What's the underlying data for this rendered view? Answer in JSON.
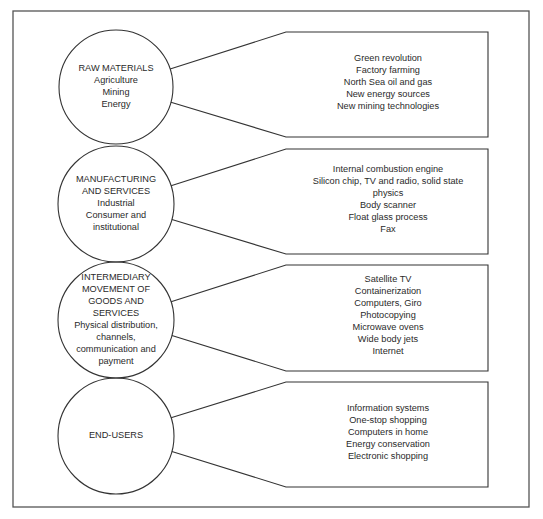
{
  "diagram": {
    "frame": {
      "x": 13,
      "y": 11,
      "w": 516,
      "h": 496,
      "stroke": "#555555"
    },
    "stroke_color": "#333333",
    "rows": [
      {
        "circle": {
          "cx": 116,
          "cy": 87,
          "r": 57
        },
        "circle_lines": [
          "RAW MATERIALS",
          "Agriculture",
          "Mining",
          "Energy"
        ],
        "box": {
          "top": 32,
          "bottom": 137
        },
        "box_lines": [
          "Green revolution",
          "Factory farming",
          "North Sea oil and gas",
          "New energy sources",
          "New mining technologies"
        ]
      },
      {
        "circle": {
          "cx": 116,
          "cy": 204,
          "r": 58
        },
        "circle_lines": [
          "MANUFACTURING",
          "AND SERVICES",
          "Industrial",
          "Consumer and",
          "institutional"
        ],
        "box": {
          "top": 149,
          "bottom": 254
        },
        "box_lines": [
          "Internal combustion engine",
          "Silicon chip, TV and radio, solid state",
          "physics",
          "Body scanner",
          "Float glass process",
          "Fax"
        ]
      },
      {
        "circle": {
          "cx": 116,
          "cy": 320,
          "r": 58
        },
        "circle_lines": [
          "INTERMEDIARY",
          "MOVEMENT OF",
          "GOODS AND",
          "SERVICES",
          "Physical distribution,",
          "channels,",
          "communication and",
          "payment"
        ],
        "box": {
          "top": 265,
          "bottom": 371
        },
        "box_lines": [
          "Satellite TV",
          "Containerization",
          "Computers, Giro",
          "Photocopying",
          "Microwave ovens",
          "Wide body jets",
          "Internet"
        ]
      },
      {
        "circle": {
          "cx": 116,
          "cy": 436,
          "r": 58
        },
        "circle_lines": [
          "END-USERS"
        ],
        "box": {
          "top": 382,
          "bottom": 487
        },
        "box_lines": [
          "Information systems",
          "One-stop shopping",
          "Computers in home",
          "Energy conservation",
          "Electronic shopping"
        ]
      }
    ],
    "box_left": 286,
    "box_right": 488
  }
}
